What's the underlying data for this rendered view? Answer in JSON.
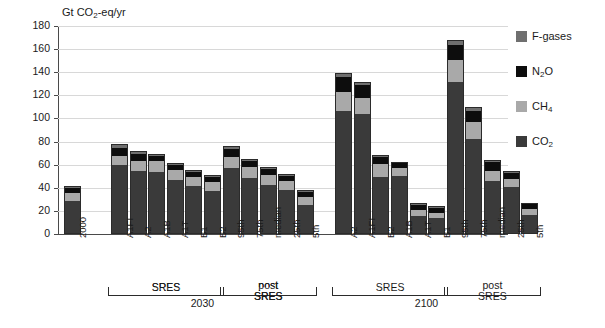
{
  "chart_data": {
    "type": "bar",
    "title": "Gt CO2-eq/yr",
    "subtype": "stacked",
    "xlabel": "",
    "ylabel": "Gt CO2-eq/yr",
    "ylim": [
      0,
      180
    ],
    "ytick_step": 20,
    "yticks": [
      "180",
      "160",
      "140",
      "120",
      "100",
      "80",
      "60",
      "40",
      "20",
      "0"
    ],
    "grid": true,
    "legend_position": "right",
    "series": [
      {
        "name": "CO2",
        "color": "#3a3a3a",
        "values": [
          28.0,
          59.0,
          54.0,
          53.0,
          45.5,
          40.5,
          36.0,
          56.0,
          48.0,
          41.5,
          37.0,
          24.5,
          106.0,
          103.0,
          48.5,
          49.5,
          14.5,
          13.0,
          131.0,
          81.0,
          45.0,
          40.0,
          15.5
        ]
      },
      {
        "name": "CH4",
        "color": "#a9a9a9",
        "values": [
          7.0,
          8.0,
          8.5,
          9.5,
          9.0,
          8.0,
          8.0,
          9.5,
          9.0,
          9.0,
          8.0,
          7.0,
          16.0,
          14.0,
          11.5,
          7.0,
          5.0,
          4.5,
          19.0,
          15.0,
          9.0,
          7.0,
          5.5
        ]
      },
      {
        "name": "N2O",
        "color": "#0d0d0d",
        "values": [
          4.0,
          7.0,
          6.0,
          4.0,
          4.5,
          4.5,
          4.5,
          7.5,
          5.0,
          4.5,
          4.0,
          4.0,
          13.0,
          11.0,
          6.0,
          4.0,
          4.5,
          4.0,
          13.0,
          10.0,
          7.5,
          5.0,
          4.0
        ]
      },
      {
        "name": "F-gases",
        "color": "#6f6f6f",
        "values": [
          1.0,
          2.0,
          1.5,
          1.0,
          1.0,
          1.0,
          1.0,
          1.5,
          1.0,
          1.0,
          1.0,
          0.5,
          3.0,
          2.0,
          1.0,
          0.5,
          1.0,
          1.0,
          3.0,
          2.0,
          1.0,
          1.0,
          0.5
        ]
      }
    ],
    "categories": [
      "2000",
      "A1FI",
      "A2",
      "A1B",
      "A1T",
      "B1",
      "B2",
      "95th",
      "75th",
      "median",
      "25th",
      "5th",
      "A2",
      "A1FI",
      "B2",
      "A1B",
      "A1T",
      "B1",
      "95th",
      "75th",
      "median",
      "25th",
      "5th"
    ],
    "totals": [
      40,
      76,
      70,
      67.5,
      60,
      54,
      49.5,
      74.5,
      63,
      56,
      50,
      36,
      138,
      130,
      67,
      61,
      25,
      22.5,
      166,
      108,
      62.5,
      53,
      25.5
    ],
    "group_brackets": [
      {
        "label": "SRES",
        "period": "2030"
      },
      {
        "label": "post SRES",
        "period": "2030"
      },
      {
        "label": "SRES",
        "period": "2100"
      },
      {
        "label": "post SRES",
        "period": "2100"
      }
    ],
    "period_labels": [
      "2030",
      "2100"
    ]
  },
  "axis": {
    "title_main": "Gt CO",
    "title_sub": "2",
    "title_rest": "-eq/yr",
    "ticks": [
      "180",
      "160",
      "140",
      "120",
      "100",
      "80",
      "60",
      "40",
      "20",
      "0"
    ]
  },
  "xlabels": [
    {
      "text": "2000"
    },
    {
      "text": "A1FI"
    },
    {
      "text": "A2"
    },
    {
      "text": "A1B"
    },
    {
      "text": "A1T"
    },
    {
      "text": "B1"
    },
    {
      "text": "B2"
    },
    {
      "text": "95th"
    },
    {
      "text": "75th"
    },
    {
      "text": "median"
    },
    {
      "text": "25th"
    },
    {
      "text": "5th"
    },
    {
      "text": "A2"
    },
    {
      "text": "A1FI"
    },
    {
      "text": "B2"
    },
    {
      "text": "A1B"
    },
    {
      "text": "A1T"
    },
    {
      "text": "B1"
    },
    {
      "text": "95th"
    },
    {
      "text": "75th"
    },
    {
      "text": "median"
    },
    {
      "text": "25th"
    },
    {
      "text": "5th"
    }
  ],
  "brackets": {
    "sres_2030": "SRES",
    "post_sres_2030_line1": "post",
    "post_sres_2030_line2": "SRES",
    "year_2030": "2030",
    "sres_2100": "SRES",
    "post_sres_2100_line1": "post",
    "post_sres_2100_line2": "SRES",
    "year_2100": "2100"
  },
  "legend": {
    "items": [
      {
        "label_main": "F-gases",
        "label_sub": "",
        "label_rest": "",
        "color": "#6f6f6f"
      },
      {
        "label_main": "N",
        "label_sub": "2",
        "label_rest": "O",
        "color": "#0d0d0d"
      },
      {
        "label_main": "CH",
        "label_sub": "4",
        "label_rest": "",
        "color": "#a9a9a9"
      },
      {
        "label_main": "CO",
        "label_sub": "2",
        "label_rest": "",
        "color": "#3a3a3a"
      }
    ]
  }
}
